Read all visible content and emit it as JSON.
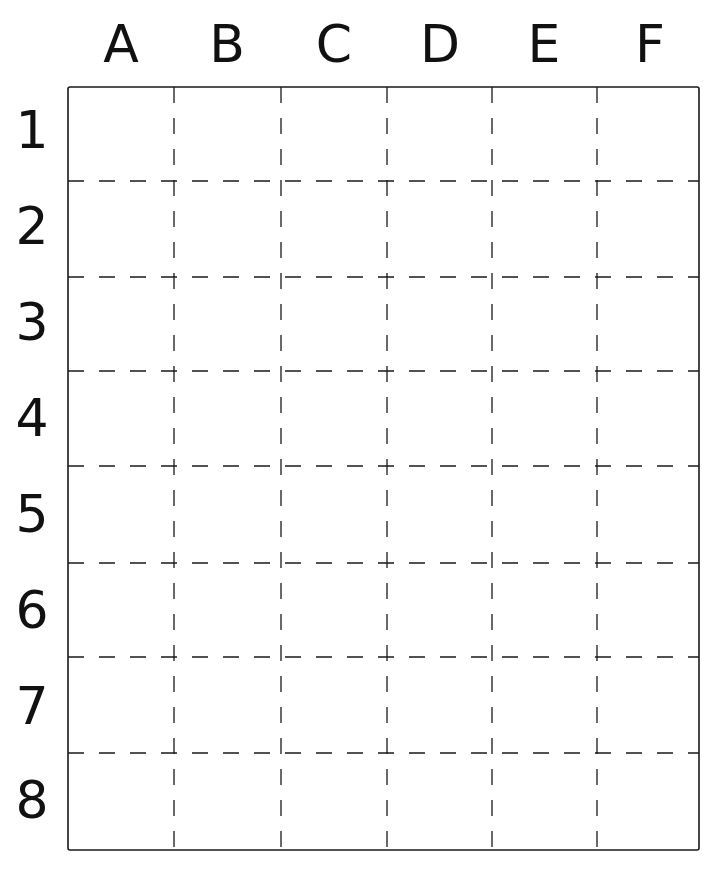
{
  "grid": {
    "columns": [
      "A",
      "B",
      "C",
      "D",
      "E",
      "F"
    ],
    "rows": [
      "1",
      "2",
      "3",
      "4",
      "5",
      "6",
      "7",
      "8"
    ],
    "bounds": {
      "left": 68,
      "top": 87,
      "right": 699,
      "bottom": 850
    },
    "line_color": "#1a1a1a",
    "divider_style": "dashed"
  }
}
